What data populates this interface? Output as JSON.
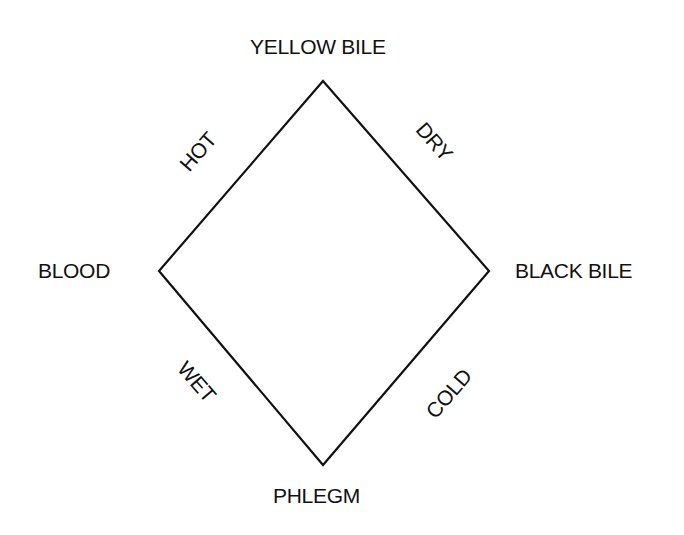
{
  "diagram": {
    "vertices": {
      "top": "YELLOW BILE",
      "left": "BLOOD",
      "right": "BLACK BILE",
      "bottom": "PHLEGM"
    },
    "edges": {
      "top_left": "HOT",
      "top_right": "DRY",
      "bottom_left": "WET",
      "bottom_right": "COLD"
    },
    "colors": {
      "line": "#111111",
      "text": "#111111",
      "background": "#ffffff"
    }
  }
}
